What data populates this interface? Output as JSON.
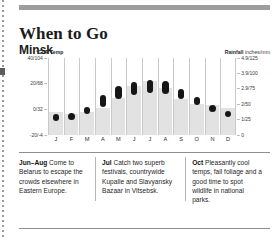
{
  "page": {
    "title": "When to Go",
    "subtitle": "Minsk"
  },
  "axes": {
    "temp_caption_unit": "°C/°F",
    "temp_caption_word": "Temp",
    "rain_caption_word": "Rainfall",
    "rain_caption_unit": "inches/mm"
  },
  "chart_data": {
    "type": "bar",
    "title": "Minsk",
    "subtitle": "When to Go",
    "categories": [
      "J",
      "F",
      "M",
      "A",
      "M",
      "J",
      "J",
      "A",
      "S",
      "O",
      "N",
      "D"
    ],
    "month_names": [
      "Jan",
      "Feb",
      "Mar",
      "Apr",
      "May",
      "Jun",
      "Jul",
      "Aug",
      "Sep",
      "Oct",
      "Nov",
      "Dec"
    ],
    "xlabel": "",
    "grid": "vertical-month-separators",
    "legend": "none",
    "series": [
      {
        "name": "Temp",
        "type": "range-bar",
        "unit": "°C",
        "ylabel": "°C/°F Temp",
        "ylim": [
          -20,
          40
        ],
        "ticks": [
          {
            "value": 40,
            "label": "40/104"
          },
          {
            "value": 20,
            "label": "20/68"
          },
          {
            "value": 0,
            "label": "0/32"
          },
          {
            "value": -20,
            "label": "-20/-4"
          }
        ],
        "low": [
          -9,
          -8,
          -4,
          2,
          8,
          11,
          13,
          12,
          8,
          3,
          -2,
          -6
        ],
        "high": [
          -4,
          -3,
          2,
          11,
          18,
          21,
          23,
          22,
          16,
          10,
          3,
          -1
        ]
      },
      {
        "name": "Rainfall",
        "type": "bar",
        "unit": "mm",
        "ylabel": "Rainfall inches/mm",
        "ylim": [
          0,
          125
        ],
        "ticks": [
          {
            "value": 125,
            "label": "4.9/125"
          },
          {
            "value": 100,
            "label": "3.9/100"
          },
          {
            "value": 75,
            "label": "2.9/75"
          },
          {
            "value": 50,
            "label": "2/50"
          },
          {
            "value": 25,
            "label": "1/25"
          },
          {
            "value": 0,
            "label": "0"
          }
        ],
        "values": [
          38,
          34,
          38,
          44,
          60,
          80,
          88,
          76,
          58,
          50,
          48,
          44
        ]
      }
    ]
  },
  "notes": [
    {
      "period": "Jun–Aug",
      "text": " Come to Belarus to escape the crowds elsewhere in Eastern Europe."
    },
    {
      "period": "Jul",
      "text": " Catch two superb festivals, countrywide Kupalle and Slavyansky Bazaar in Vitsebsk."
    },
    {
      "period": "Oct",
      "text": " Pleasantly cool temps, fall foliage and a good time to spot wildlife in national parks."
    }
  ]
}
